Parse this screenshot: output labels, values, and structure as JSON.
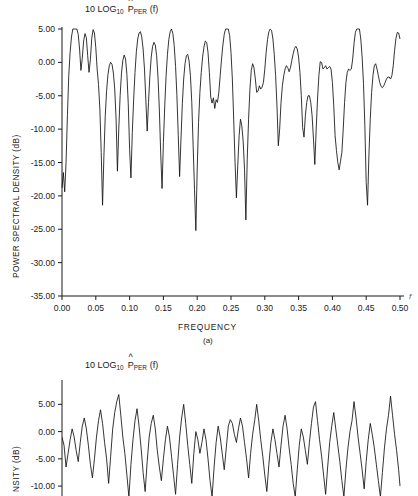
{
  "figure": {
    "caption_a": "(a)",
    "y_axis_label_full": "POWER SPECTRAL DENSITY (dB)",
    "y_axis_label_truncated": "NSITY (dB)",
    "x_axis_label": "FREQUENCY",
    "frequency_variable": "f"
  },
  "heading": {
    "prefix": "10 LOG",
    "log_base": "10",
    "symbol": "P",
    "hat": "^",
    "subscript": "PER",
    "argument": "(f)"
  },
  "chart_data": [
    {
      "type": "line",
      "id": "panel-a",
      "title": "10 LOG10 P^PER (f)",
      "xlabel": "FREQUENCY",
      "ylabel": "POWER SPECTRAL DENSITY (dB)",
      "xlim": [
        0.0,
        0.5
      ],
      "ylim": [
        -35.0,
        5.0
      ],
      "xticks": [
        0.0,
        0.05,
        0.1,
        0.15,
        0.2,
        0.25,
        0.3,
        0.35,
        0.4,
        0.45,
        0.5
      ],
      "xtick_labels": [
        "0.00",
        "0.05",
        "0.10",
        "0.15",
        "0.20",
        "0.25",
        "0.30",
        "0.35",
        "0.40",
        "0.45",
        "0.50"
      ],
      "yticks": [
        5.0,
        0.0,
        -5.0,
        -10.0,
        -15.0,
        -20.0,
        -25.0,
        -30.0,
        -35.0
      ],
      "ytick_labels": [
        "5.00",
        "0.00",
        "-5.00",
        "-10.00",
        "-15.00",
        "-20.00",
        "-25.00",
        "-30.00",
        "-35.00"
      ],
      "grid": false,
      "legend": null,
      "series": [
        {
          "name": "periodogram estimate",
          "color": "#111111",
          "x": [
            0.0,
            0.002,
            0.004,
            0.006,
            0.008,
            0.01,
            0.012,
            0.014,
            0.016,
            0.018,
            0.02,
            0.022,
            0.024,
            0.026,
            0.028,
            0.03,
            0.032,
            0.034,
            0.036,
            0.038,
            0.04,
            0.042,
            0.044,
            0.046,
            0.048,
            0.05,
            0.052,
            0.054,
            0.056,
            0.058,
            0.06,
            0.062,
            0.064,
            0.066,
            0.068,
            0.07,
            0.072,
            0.074,
            0.076,
            0.078,
            0.08,
            0.082,
            0.084,
            0.086,
            0.088,
            0.09,
            0.092,
            0.094,
            0.096,
            0.098,
            0.1,
            0.102,
            0.104,
            0.106,
            0.108,
            0.11,
            0.112,
            0.114,
            0.116,
            0.118,
            0.12,
            0.122,
            0.124,
            0.126,
            0.128,
            0.13,
            0.132,
            0.134,
            0.136,
            0.138,
            0.14,
            0.142,
            0.144,
            0.146,
            0.148,
            0.15,
            0.152,
            0.154,
            0.156,
            0.158,
            0.16,
            0.162,
            0.164,
            0.166,
            0.168,
            0.17,
            0.172,
            0.174,
            0.176,
            0.178,
            0.18,
            0.182,
            0.184,
            0.186,
            0.188,
            0.19,
            0.192,
            0.194,
            0.196,
            0.198,
            0.2,
            0.202,
            0.204,
            0.206,
            0.208,
            0.21,
            0.212,
            0.214,
            0.216,
            0.218,
            0.22,
            0.222,
            0.224,
            0.226,
            0.228,
            0.23,
            0.232,
            0.234,
            0.236,
            0.238,
            0.24,
            0.242,
            0.244,
            0.246,
            0.248,
            0.25,
            0.252,
            0.254,
            0.256,
            0.258,
            0.26,
            0.262,
            0.264,
            0.266,
            0.268,
            0.27,
            0.272,
            0.274,
            0.276,
            0.278,
            0.28,
            0.282,
            0.284,
            0.286,
            0.288,
            0.29,
            0.292,
            0.294,
            0.296,
            0.298,
            0.3,
            0.302,
            0.304,
            0.306,
            0.308,
            0.31,
            0.312,
            0.314,
            0.316,
            0.318,
            0.32,
            0.322,
            0.324,
            0.326,
            0.328,
            0.33,
            0.332,
            0.334,
            0.336,
            0.338,
            0.34,
            0.342,
            0.344,
            0.346,
            0.348,
            0.35,
            0.352,
            0.354,
            0.356,
            0.358,
            0.36,
            0.362,
            0.364,
            0.366,
            0.368,
            0.37,
            0.372,
            0.374,
            0.376,
            0.378,
            0.38,
            0.382,
            0.384,
            0.386,
            0.388,
            0.39,
            0.392,
            0.394,
            0.396,
            0.398,
            0.4,
            0.402,
            0.404,
            0.406,
            0.408,
            0.41,
            0.412,
            0.414,
            0.416,
            0.418,
            0.42,
            0.422,
            0.424,
            0.426,
            0.428,
            0.43,
            0.432,
            0.434,
            0.436,
            0.438,
            0.44,
            0.442,
            0.444,
            0.446,
            0.448,
            0.45,
            0.452,
            0.454,
            0.456,
            0.458,
            0.46,
            0.462,
            0.464,
            0.466,
            0.468,
            0.47,
            0.472,
            0.474,
            0.476,
            0.478,
            0.48,
            0.482,
            0.484,
            0.486,
            0.488,
            0.49,
            0.492,
            0.494,
            0.496,
            0.498,
            0.5
          ],
          "y": [
            -18.8,
            -16.5,
            -19.4,
            -15.0,
            -8.0,
            -2.0,
            1.5,
            3.8,
            5.2,
            5.8,
            5.9,
            5.4,
            4.2,
            2.0,
            -1.2,
            0.6,
            3.2,
            4.3,
            3.7,
            1.0,
            -1.5,
            0.4,
            3.6,
            4.9,
            4.4,
            2.2,
            -1.0,
            -3.3,
            -7.0,
            -13.5,
            -21.4,
            -14.0,
            -8.0,
            -4.2,
            -1.8,
            -0.5,
            0.0,
            -0.3,
            -1.6,
            -4.0,
            -8.5,
            -16.3,
            -10.0,
            -5.0,
            -1.6,
            0.3,
            1.1,
            0.5,
            -1.8,
            -6.2,
            -13.0,
            -17.3,
            -10.5,
            -5.5,
            -1.5,
            1.6,
            3.5,
            4.4,
            4.6,
            3.8,
            2.0,
            -1.0,
            -5.5,
            -10.3,
            -6.0,
            -2.0,
            0.8,
            2.4,
            3.0,
            2.6,
            1.0,
            -2.2,
            -7.0,
            -13.6,
            -18.9,
            -12.0,
            -6.5,
            -2.0,
            1.2,
            3.4,
            4.6,
            5.0,
            4.3,
            2.5,
            -0.6,
            -5.0,
            -11.0,
            -17.1,
            -11.5,
            -6.2,
            -2.5,
            -0.2,
            1.0,
            1.2,
            0.2,
            -2.0,
            -6.0,
            -12.5,
            -19.0,
            -25.2,
            -16.0,
            -9.0,
            -4.5,
            -1.5,
            0.8,
            2.3,
            3.2,
            3.0,
            1.5,
            -1.5,
            -5.2,
            -6.1,
            -5.3,
            -6.9,
            -5.6,
            -6.0,
            -4.5,
            -2.0,
            0.5,
            2.6,
            4.2,
            5.2,
            5.7,
            5.4,
            4.0,
            1.5,
            -2.5,
            -8.5,
            -15.0,
            -20.3,
            -15.5,
            -11.0,
            -8.5,
            -9.5,
            -11.8,
            -16.0,
            -23.6,
            -14.5,
            -8.5,
            -4.0,
            -1.2,
            -0.2,
            -0.8,
            -2.5,
            -4.5,
            -4.3,
            -3.5,
            -4.0,
            -3.7,
            -3.0,
            -1.0,
            1.5,
            3.4,
            4.6,
            5.1,
            4.8,
            3.5,
            1.2,
            -2.0,
            -6.5,
            -12.5,
            -10.0,
            -6.0,
            -3.5,
            -2.0,
            -1.0,
            -0.5,
            -0.8,
            -1.4,
            -0.8,
            0.3,
            1.3,
            2.1,
            2.4,
            2.0,
            0.8,
            -1.5,
            -5.0,
            -9.8,
            -11.2,
            -8.0,
            -6.0,
            -5.0,
            -5.0,
            -6.0,
            -8.0,
            -11.5,
            -15.3,
            -10.0,
            -5.5,
            -2.0,
            0.1,
            0.0,
            -1.0,
            -0.8,
            -0.5,
            -1.0,
            -0.8,
            -0.6,
            -1.0,
            -3.0,
            -6.5,
            -11.0,
            -13.2,
            -15.0,
            -16.1,
            -14.8,
            -13.5,
            -10.0,
            -6.0,
            -3.0,
            -1.5,
            -1.0,
            -1.2,
            -1.0,
            0.5,
            2.8,
            4.5,
            5.4,
            5.6,
            5.0,
            3.5,
            0.8,
            -3.2,
            -9.5,
            -18.0,
            -21.4,
            -14.0,
            -8.5,
            -4.5,
            -2.0,
            -0.5,
            -0.2,
            -1.0,
            -2.0,
            -3.0,
            -3.6,
            -3.8,
            -3.5,
            -3.0,
            -2.5,
            -2.2,
            -2.2,
            -2.5,
            -2.0,
            -0.5,
            1.8,
            3.6,
            4.5,
            4.4,
            3.5,
            2.0,
            0.5,
            -0.8,
            -1.5,
            -1.0,
            0.5,
            2.5,
            4.3,
            5.5,
            5.8,
            5.5,
            4.6,
            3.2,
            1.5,
            -0.5,
            -2.5,
            -4.5,
            -6.0,
            -5.0
          ]
        }
      ]
    },
    {
      "type": "line",
      "id": "panel-b",
      "title": "10 LOG10 P^PER (f)",
      "xlabel": "FREQUENCY",
      "ylabel": "POWER SPECTRAL DENSITY (dB)",
      "xlim": [
        0.0,
        0.5
      ],
      "ylim": [
        -12.0,
        8.0
      ],
      "yticks": [
        5.0,
        0.0,
        -5.0,
        -10.0
      ],
      "ytick_labels": [
        "5.00",
        "0.00",
        "-5.00",
        "-10.00"
      ],
      "grid": false,
      "legend": null,
      "note": "lower panel is cropped by the image boundary; only the region above approximately -12 dB is visible",
      "series": [
        {
          "name": "periodogram estimate",
          "color": "#111111",
          "x": [
            0.0,
            0.003,
            0.006,
            0.009,
            0.012,
            0.015,
            0.018,
            0.021,
            0.024,
            0.027,
            0.03,
            0.033,
            0.036,
            0.039,
            0.042,
            0.045,
            0.048,
            0.051,
            0.054,
            0.057,
            0.06,
            0.063,
            0.066,
            0.069,
            0.072,
            0.075,
            0.078,
            0.081,
            0.084,
            0.087,
            0.09,
            0.093,
            0.096,
            0.099,
            0.102,
            0.105,
            0.108,
            0.111,
            0.114,
            0.117,
            0.12,
            0.123,
            0.126,
            0.129,
            0.132,
            0.135,
            0.138,
            0.141,
            0.144,
            0.147,
            0.15,
            0.153,
            0.156,
            0.159,
            0.162,
            0.165,
            0.168,
            0.171,
            0.174,
            0.177,
            0.18,
            0.183,
            0.186,
            0.189,
            0.192,
            0.195,
            0.198,
            0.201,
            0.204,
            0.207,
            0.21,
            0.213,
            0.216,
            0.219,
            0.222,
            0.225,
            0.228,
            0.231,
            0.234,
            0.237,
            0.24,
            0.243,
            0.246,
            0.249,
            0.252,
            0.255,
            0.258,
            0.261,
            0.264,
            0.267,
            0.27,
            0.273,
            0.276,
            0.279,
            0.282,
            0.285,
            0.288,
            0.291,
            0.294,
            0.297,
            0.3,
            0.303,
            0.306,
            0.309,
            0.312,
            0.315,
            0.318,
            0.321,
            0.324,
            0.327,
            0.33,
            0.333,
            0.336,
            0.339,
            0.342,
            0.345,
            0.348,
            0.351,
            0.354,
            0.357,
            0.36,
            0.363,
            0.366,
            0.369,
            0.372,
            0.375,
            0.378,
            0.381,
            0.384,
            0.387,
            0.39,
            0.393,
            0.396,
            0.399,
            0.402,
            0.405,
            0.408,
            0.411,
            0.414,
            0.417,
            0.42,
            0.423,
            0.426,
            0.429,
            0.432,
            0.435,
            0.438,
            0.441,
            0.444,
            0.447,
            0.45,
            0.453,
            0.456,
            0.459,
            0.462,
            0.465,
            0.468,
            0.471,
            0.474,
            0.477,
            0.48,
            0.483,
            0.486,
            0.489,
            0.492,
            0.495,
            0.498,
            0.5
          ],
          "y": [
            -1.0,
            -2.5,
            -6.5,
            -4.0,
            -1.5,
            0.5,
            -1.0,
            -3.5,
            -5.5,
            -2.0,
            1.0,
            2.5,
            0.5,
            -2.5,
            -6.0,
            -8.5,
            -5.0,
            -1.0,
            2.0,
            4.0,
            1.5,
            -2.0,
            -5.0,
            -9.5,
            -4.5,
            0.5,
            3.5,
            5.5,
            6.8,
            3.0,
            -1.0,
            -4.0,
            -8.0,
            -12.0,
            -6.0,
            -1.5,
            2.0,
            4.2,
            1.0,
            -3.0,
            -7.5,
            -11.0,
            -5.5,
            -1.0,
            1.5,
            3.0,
            0.5,
            -3.5,
            -6.5,
            -9.0,
            -5.0,
            -1.5,
            1.0,
            -1.0,
            -4.5,
            -8.0,
            -11.5,
            -6.0,
            -1.0,
            2.5,
            5.0,
            1.5,
            -2.5,
            -6.0,
            -9.5,
            -4.0,
            0.0,
            -1.5,
            -4.0,
            -2.0,
            0.5,
            -1.5,
            -5.0,
            -9.0,
            -12.0,
            -6.5,
            -2.0,
            1.0,
            -1.0,
            -4.0,
            -7.0,
            -3.0,
            1.0,
            2.2,
            1.5,
            -0.5,
            -2.0,
            0.5,
            2.5,
            1.0,
            -2.0,
            -5.0,
            -8.5,
            -4.0,
            -0.5,
            2.0,
            5.0,
            2.0,
            -1.5,
            -4.5,
            -8.0,
            -11.0,
            -6.0,
            -2.0,
            0.5,
            -1.5,
            -4.0,
            -6.5,
            -2.5,
            1.0,
            3.0,
            0.5,
            -3.0,
            -6.0,
            -9.5,
            -12.0,
            -7.0,
            -2.5,
            0.5,
            -1.0,
            -3.5,
            -6.0,
            -2.0,
            1.5,
            4.5,
            5.5,
            2.0,
            -1.5,
            -4.5,
            -8.0,
            -11.5,
            -6.5,
            -2.0,
            1.0,
            3.5,
            0.5,
            -2.5,
            -5.5,
            -9.0,
            -12.0,
            -7.0,
            -3.0,
            0.0,
            2.0,
            5.5,
            2.5,
            -1.0,
            -4.0,
            -7.0,
            -10.5,
            -5.5,
            -1.5,
            1.5,
            -0.5,
            -3.0,
            -6.0,
            -9.0,
            -12.0,
            -7.5,
            -3.0,
            0.5,
            3.0,
            6.5,
            3.0,
            -0.5,
            -3.5,
            -7.0,
            -10.0,
            -5.0,
            -1.0,
            2.0,
            4.5,
            1.5,
            -2.0,
            -5.0,
            -3.0
          ]
        }
      ]
    }
  ]
}
